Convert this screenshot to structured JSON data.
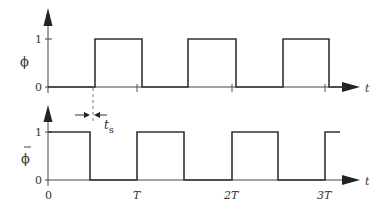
{
  "diagram": {
    "type": "timing-diagram",
    "colors": {
      "line": "#333333",
      "axis": "#444444",
      "background": "#ffffff"
    },
    "top_plot": {
      "signal_label": "ϕ",
      "y_tick_labels": [
        "1",
        "0"
      ],
      "x_axis_label": "t",
      "waveform": [
        {
          "from": "0",
          "to": "t_s",
          "level": 0
        },
        {
          "from": "t_s",
          "to": "T/2+t_s",
          "level": 1
        },
        {
          "from": "T/2+t_s",
          "to": "T+t_s",
          "level": 0
        },
        {
          "from": "T+t_s",
          "to": "3T/2+t_s",
          "level": 1
        },
        {
          "from": "3T/2+t_s",
          "to": "2T+t_s",
          "level": 0
        },
        {
          "from": "2T+t_s",
          "to": "5T/2+t_s",
          "level": 1
        },
        {
          "from": "5T/2+t_s",
          "to": "3T+t_s",
          "level": 0
        }
      ]
    },
    "bottom_plot": {
      "signal_label": "ϕ̄",
      "signal_label_bar": "—",
      "signal_label_base": "ϕ",
      "y_tick_labels": [
        "1",
        "0"
      ],
      "x_axis_label": "t",
      "x_tick_labels": [
        "0",
        "T",
        "2T",
        "3T"
      ],
      "waveform": [
        {
          "from": "0",
          "to": "T/2",
          "level": 1
        },
        {
          "from": "T/2",
          "to": "T",
          "level": 0
        },
        {
          "from": "T",
          "to": "3T/2",
          "level": 1
        },
        {
          "from": "3T/2",
          "to": "2T",
          "level": 0
        },
        {
          "from": "2T",
          "to": "5T/2",
          "level": 1
        },
        {
          "from": "5T/2",
          "to": "3T",
          "level": 0
        },
        {
          "from": "3T",
          "to": "…",
          "level": 1
        }
      ]
    },
    "annotation": {
      "label_base": "t",
      "label_sub": "s",
      "meaning": "skew / delay between φ̄ falling edge and φ rising edge"
    }
  }
}
